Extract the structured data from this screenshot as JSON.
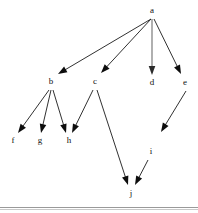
{
  "figure": {
    "width": 198,
    "height": 213,
    "background_color": "#ffffff",
    "rule_color": "#9a9a9a"
  },
  "graph": {
    "type": "directed-acyclic-graph",
    "node_color": "#111111",
    "edge_color": "#1a1a1a",
    "nodes": [
      {
        "id": "a",
        "label": "a",
        "x": 152,
        "y": 11
      },
      {
        "id": "b",
        "label": "b",
        "x": 51,
        "y": 82
      },
      {
        "id": "c",
        "label": "c",
        "x": 95,
        "y": 82
      },
      {
        "id": "d",
        "label": "d",
        "x": 152,
        "y": 83
      },
      {
        "id": "e",
        "label": "e",
        "x": 185,
        "y": 83
      },
      {
        "id": "f",
        "label": "f",
        "x": 13,
        "y": 141
      },
      {
        "id": "g",
        "label": "g",
        "x": 40,
        "y": 141
      },
      {
        "id": "h",
        "label": "h",
        "x": 69,
        "y": 141
      },
      {
        "id": "i",
        "label": "i",
        "x": 151,
        "y": 152
      },
      {
        "id": "j",
        "label": "j",
        "x": 131,
        "y": 194
      }
    ],
    "edges": [
      {
        "from": "a",
        "to": "b",
        "x1": 151,
        "y1": 19,
        "x2": 58,
        "y2": 74,
        "style": "solid"
      },
      {
        "from": "a",
        "to": "c",
        "x1": 151,
        "y1": 19,
        "x2": 101,
        "y2": 73,
        "style": "solid"
      },
      {
        "from": "a",
        "to": "d",
        "x1": 152,
        "y1": 19,
        "x2": 152,
        "y2": 75,
        "style": "muted"
      },
      {
        "from": "a",
        "to": "e",
        "x1": 154,
        "y1": 19,
        "x2": 181,
        "y2": 74,
        "style": "solid"
      },
      {
        "from": "b",
        "to": "f",
        "x1": 49,
        "y1": 90,
        "x2": 18,
        "y2": 133,
        "style": "solid"
      },
      {
        "from": "b",
        "to": "g",
        "x1": 51,
        "y1": 90,
        "x2": 41,
        "y2": 133,
        "style": "solid"
      },
      {
        "from": "b",
        "to": "h",
        "x1": 53,
        "y1": 90,
        "x2": 66,
        "y2": 133,
        "style": "solid"
      },
      {
        "from": "c",
        "to": "h",
        "x1": 93,
        "y1": 90,
        "x2": 72,
        "y2": 133,
        "style": "solid"
      },
      {
        "from": "c",
        "to": "j",
        "x1": 97,
        "y1": 90,
        "x2": 128,
        "y2": 185,
        "style": "solid"
      },
      {
        "from": "e",
        "to": "i",
        "x1": 186,
        "y1": 91,
        "x2": 161,
        "y2": 132,
        "style": "solid"
      },
      {
        "from": "i",
        "to": "j",
        "x1": 148,
        "y1": 160,
        "x2": 135,
        "y2": 185,
        "style": "solid"
      }
    ],
    "edge_count": 11,
    "node_count": 10
  }
}
